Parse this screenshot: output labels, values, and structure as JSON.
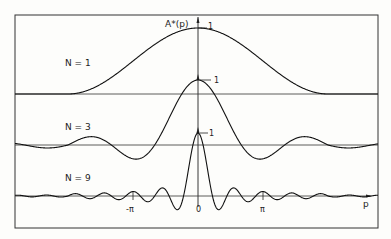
{
  "chart_data": {
    "type": "line",
    "title": "",
    "xlabel": "p",
    "ylabel": "A*(p)",
    "x_ticks": [
      "-π",
      "0",
      "π"
    ],
    "x_tick_values": [
      -3.1416,
      0,
      3.1416
    ],
    "xlim": [
      -4.9,
      6.0
    ],
    "grid": false,
    "legend": "inline labels left of each curve",
    "series": [
      {
        "name": "N = 1",
        "peak_value": 1,
        "description": "single broad bell-shaped curve, zero at ±2π"
      },
      {
        "name": "N = 3",
        "peak_value": 1,
        "description": "central peak at 0, secondary maxima near ±π, negative lobes between"
      },
      {
        "name": "N = 9",
        "peak_value": 1,
        "description": "narrow central peak at 0, principal maxima at ±π, many small side lobes"
      }
    ],
    "annotations": [
      "1",
      "1",
      "1"
    ]
  },
  "labels": {
    "ylabel": "A*(p)",
    "xlabel": "p",
    "n1": "N = 1",
    "n3": "N = 3",
    "n9": "N = 9",
    "one": "1",
    "tick_neg_pi": "-π",
    "tick_zero": "0",
    "tick_pi": "π"
  }
}
